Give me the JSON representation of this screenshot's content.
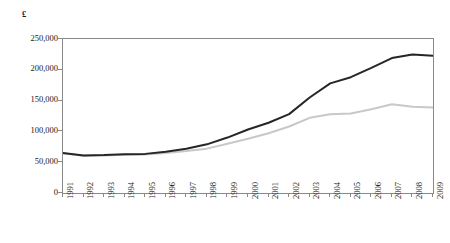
{
  "chart_data": {
    "type": "line",
    "title": "",
    "xlabel": "",
    "ylabel": "",
    "unit_label": "£",
    "grid": false,
    "legend": "none",
    "ylim": [
      0,
      250000
    ],
    "yticks": [
      0,
      50000,
      100000,
      150000,
      200000,
      250000
    ],
    "ytick_labels": [
      "0",
      "50,000",
      "100,000",
      "150,000",
      "200,000",
      "250,000"
    ],
    "categories": [
      "1991",
      "1992",
      "1993",
      "1994",
      "1995",
      "1996",
      "1997",
      "1998",
      "1999",
      "2000",
      "2001",
      "2002",
      "2003",
      "2004",
      "2005",
      "2006",
      "2007",
      "2008",
      "2009"
    ],
    "series": [
      {
        "name": "upper-series",
        "color": "#262626",
        "width": 2.0,
        "values": [
          65000,
          61000,
          61500,
          63000,
          63500,
          67000,
          72000,
          79000,
          90000,
          103000,
          114000,
          128000,
          155000,
          178000,
          188000,
          203000,
          219000,
          225000,
          223000
        ]
      },
      {
        "name": "lower-series",
        "color": "#c8c8c8",
        "width": 2.0,
        "values": [
          64000,
          60500,
          61000,
          62000,
          62500,
          65000,
          68000,
          72000,
          80000,
          88000,
          97000,
          108000,
          122000,
          128000,
          129000,
          136000,
          144000,
          140000,
          139000
        ]
      }
    ]
  },
  "colors": {
    "axis": "#8a8a8a",
    "text": "#1a1a1a",
    "background": "#ffffff"
  }
}
